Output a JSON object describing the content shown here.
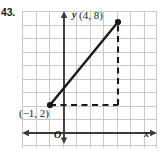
{
  "problem": {
    "number": "43."
  },
  "figure": {
    "type": "coordinate-grid-line-segment",
    "axis_labels": {
      "x": "x",
      "y": "y",
      "origin": "O"
    },
    "points": [
      {
        "name": "point-a",
        "label": "(−1, 2)",
        "x": -1,
        "y": 2
      },
      {
        "name": "point-b",
        "label": "(4, 8)",
        "x": 4,
        "y": 8
      }
    ],
    "segment": {
      "from": "(−1, 2)",
      "to": "(4, 8)"
    },
    "dashed_guides": [
      {
        "name": "horizontal-guide",
        "from": "(−1, 2)",
        "to": "(4, 2)"
      },
      {
        "name": "vertical-guide",
        "from": "(4, 2)",
        "to": "(4, 8)"
      }
    ],
    "grid": {
      "cell_size": 13.5,
      "columns": 10,
      "rows": 10,
      "visible": true
    },
    "colors": {
      "grid_line": "#c9c9c9",
      "axis": "#3b3b3b",
      "segment": "#1a1a1a",
      "dashed": "#1a1a1a",
      "background": "#ffffff"
    }
  }
}
